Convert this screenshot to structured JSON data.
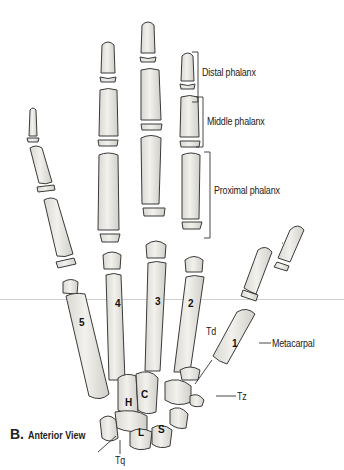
{
  "figure": {
    "title_letter": "B.",
    "title_text": "Anterior View"
  },
  "labels": {
    "distal_phalanx": "Distal phalanx",
    "middle_phalanx": "Middle phalanx",
    "proximal_phalanx": "Proximal phalanx",
    "metacarpal": "Metacarpal",
    "td": "Td",
    "tz": "Tz",
    "tq": "Tq"
  },
  "metacarpal_numbers": [
    "1",
    "2",
    "3",
    "4",
    "5"
  ],
  "carpal_letters": {
    "hamate": "H",
    "capitate": "C",
    "lunate": "L",
    "scaphoid": "S"
  },
  "colors": {
    "bone_fill": "#ecebe6",
    "bone_stroke": "#3a3a3a",
    "line": "#333333",
    "divider": "#cfcfcf"
  }
}
